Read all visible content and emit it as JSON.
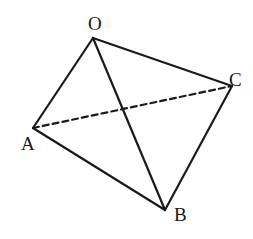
{
  "diagram": {
    "type": "tetrahedron",
    "vertices": [
      {
        "id": "O",
        "label": "O",
        "x": 93,
        "y": 38,
        "lx": 88,
        "ly": 30
      },
      {
        "id": "A",
        "label": "A",
        "x": 33,
        "y": 128,
        "lx": 21,
        "ly": 150
      },
      {
        "id": "B",
        "label": "B",
        "x": 165,
        "y": 210,
        "lx": 174,
        "ly": 221
      },
      {
        "id": "C",
        "label": "C",
        "x": 232,
        "y": 86,
        "lx": 229,
        "ly": 86
      }
    ],
    "edges": [
      {
        "from": "O",
        "to": "A",
        "style": "solid"
      },
      {
        "from": "O",
        "to": "B",
        "style": "solid"
      },
      {
        "from": "O",
        "to": "C",
        "style": "solid"
      },
      {
        "from": "A",
        "to": "B",
        "style": "solid"
      },
      {
        "from": "B",
        "to": "C",
        "style": "solid"
      },
      {
        "from": "A",
        "to": "C",
        "style": "dashed"
      }
    ],
    "line_color": "#1a1a1a"
  }
}
